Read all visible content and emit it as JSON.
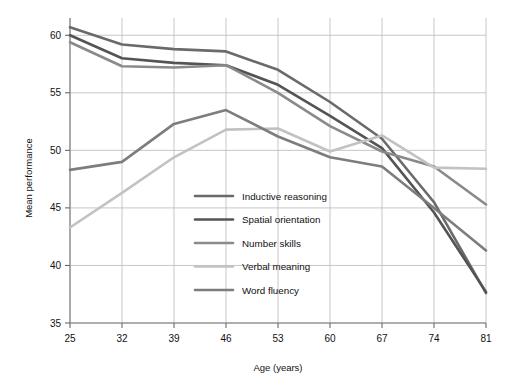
{
  "chart_data": {
    "type": "line",
    "title": "",
    "xlabel": "Age (years)",
    "ylabel": "Mean performance",
    "x": [
      25,
      32,
      39,
      46,
      53,
      60,
      67,
      74,
      81
    ],
    "categories": [
      "25",
      "32",
      "39",
      "46",
      "53",
      "60",
      "67",
      "74",
      "81"
    ],
    "xlim": [
      25,
      81
    ],
    "ylim": [
      35,
      61.5
    ],
    "yticks": [
      35,
      40,
      45,
      50,
      55,
      60
    ],
    "ytick_labels": [
      "35",
      "40",
      "45",
      "50",
      "55",
      "60"
    ],
    "grid": true,
    "legend_position": "center-left-inside",
    "series": [
      {
        "name": "Inductive reasoning",
        "color": "#6a6a6a",
        "width": 2.6,
        "values": [
          60.7,
          59.2,
          58.8,
          58.6,
          57.0,
          54.2,
          51.0,
          45.5,
          37.6
        ]
      },
      {
        "name": "Spatial orientation",
        "color": "#545454",
        "width": 2.6,
        "values": [
          60.0,
          58.0,
          57.6,
          57.4,
          55.7,
          53.0,
          50.2,
          44.6,
          37.7
        ]
      },
      {
        "name": "Number skills",
        "color": "#8a8a8a",
        "width": 2.6,
        "values": [
          59.4,
          57.3,
          57.2,
          57.4,
          55.0,
          52.1,
          49.9,
          48.6,
          45.3
        ]
      },
      {
        "name": "Verbal meaning",
        "color": "#c2c2c2",
        "width": 2.6,
        "values": [
          43.3,
          46.3,
          49.4,
          51.8,
          51.9,
          49.9,
          51.3,
          48.5,
          48.4
        ]
      },
      {
        "name": "Word fluency",
        "color": "#7d7d7d",
        "width": 2.6,
        "values": [
          48.3,
          49.0,
          52.3,
          53.5,
          51.2,
          49.4,
          48.6,
          45.0,
          41.3
        ]
      }
    ]
  },
  "legend": {
    "items": [
      {
        "label": "Inductive reasoning"
      },
      {
        "label": "Spatial orientation"
      },
      {
        "label": "Number skills"
      },
      {
        "label": "Verbal meaning"
      },
      {
        "label": "Word fluency"
      }
    ]
  }
}
